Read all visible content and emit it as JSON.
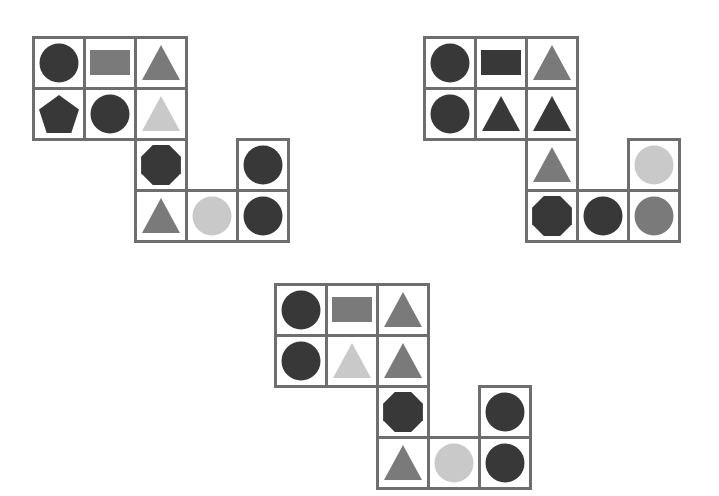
{
  "colors": {
    "dark": "#383838",
    "medium": "#7a7a7a",
    "light": "#c9c9c9",
    "border": "#6e6e6e"
  },
  "cell_size": 54,
  "puzzles": [
    {
      "name": "figure-top-left",
      "origin": [
        32,
        36
      ],
      "cells": [
        {
          "row": 0,
          "col": 0,
          "shape": "circle",
          "color": "dark"
        },
        {
          "row": 0,
          "col": 1,
          "shape": "rectangle",
          "color": "medium"
        },
        {
          "row": 0,
          "col": 2,
          "shape": "triangle",
          "color": "medium"
        },
        {
          "row": 1,
          "col": 0,
          "shape": "pentagon",
          "color": "dark"
        },
        {
          "row": 1,
          "col": 1,
          "shape": "circle",
          "color": "dark"
        },
        {
          "row": 1,
          "col": 2,
          "shape": "triangle",
          "color": "light"
        },
        {
          "row": 2,
          "col": 2,
          "shape": "octagon",
          "color": "dark"
        },
        {
          "row": 2,
          "col": 4,
          "shape": "circle",
          "color": "dark"
        },
        {
          "row": 3,
          "col": 2,
          "shape": "triangle",
          "color": "medium"
        },
        {
          "row": 3,
          "col": 3,
          "shape": "circle",
          "color": "light"
        },
        {
          "row": 3,
          "col": 4,
          "shape": "circle",
          "color": "dark"
        }
      ]
    },
    {
      "name": "figure-top-right",
      "origin": [
        423,
        36
      ],
      "cells": [
        {
          "row": 0,
          "col": 0,
          "shape": "circle",
          "color": "dark"
        },
        {
          "row": 0,
          "col": 1,
          "shape": "rectangle",
          "color": "dark"
        },
        {
          "row": 0,
          "col": 2,
          "shape": "triangle",
          "color": "medium"
        },
        {
          "row": 1,
          "col": 0,
          "shape": "circle",
          "color": "dark"
        },
        {
          "row": 1,
          "col": 1,
          "shape": "triangle",
          "color": "dark"
        },
        {
          "row": 1,
          "col": 2,
          "shape": "triangle",
          "color": "dark"
        },
        {
          "row": 2,
          "col": 2,
          "shape": "triangle",
          "color": "medium"
        },
        {
          "row": 2,
          "col": 4,
          "shape": "circle",
          "color": "light"
        },
        {
          "row": 3,
          "col": 2,
          "shape": "octagon",
          "color": "dark"
        },
        {
          "row": 3,
          "col": 3,
          "shape": "circle",
          "color": "dark"
        },
        {
          "row": 3,
          "col": 4,
          "shape": "circle",
          "color": "medium"
        }
      ]
    },
    {
      "name": "figure-bottom-center",
      "origin": [
        274,
        283
      ],
      "cells": [
        {
          "row": 0,
          "col": 0,
          "shape": "circle",
          "color": "dark"
        },
        {
          "row": 0,
          "col": 1,
          "shape": "rectangle",
          "color": "medium"
        },
        {
          "row": 0,
          "col": 2,
          "shape": "triangle",
          "color": "medium"
        },
        {
          "row": 1,
          "col": 0,
          "shape": "circle",
          "color": "dark"
        },
        {
          "row": 1,
          "col": 1,
          "shape": "triangle",
          "color": "light"
        },
        {
          "row": 1,
          "col": 2,
          "shape": "triangle",
          "color": "medium"
        },
        {
          "row": 2,
          "col": 2,
          "shape": "octagon",
          "color": "dark"
        },
        {
          "row": 2,
          "col": 4,
          "shape": "circle",
          "color": "dark"
        },
        {
          "row": 3,
          "col": 2,
          "shape": "triangle",
          "color": "medium"
        },
        {
          "row": 3,
          "col": 3,
          "shape": "circle",
          "color": "light"
        },
        {
          "row": 3,
          "col": 4,
          "shape": "circle",
          "color": "dark"
        }
      ]
    }
  ]
}
